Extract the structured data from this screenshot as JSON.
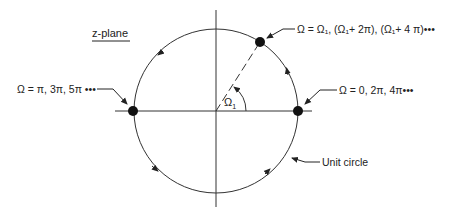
{
  "diagram": {
    "plane_label": "z-plane",
    "angle_label": "Ω",
    "angle_subscript": "1",
    "unit_circle_label": "Unit circle",
    "points": [
      {
        "id": "omega1",
        "label": "Ω = Ω₁, (Ω₁+ 2π), (Ω₁+ 4 π)•••"
      },
      {
        "id": "zero",
        "label": "Ω = 0, 2π, 4π•••"
      },
      {
        "id": "pi",
        "label": "Ω = π, 3π, 5π •••"
      }
    ],
    "colors": {
      "ink": "#222222",
      "background": "#ffffff"
    }
  }
}
